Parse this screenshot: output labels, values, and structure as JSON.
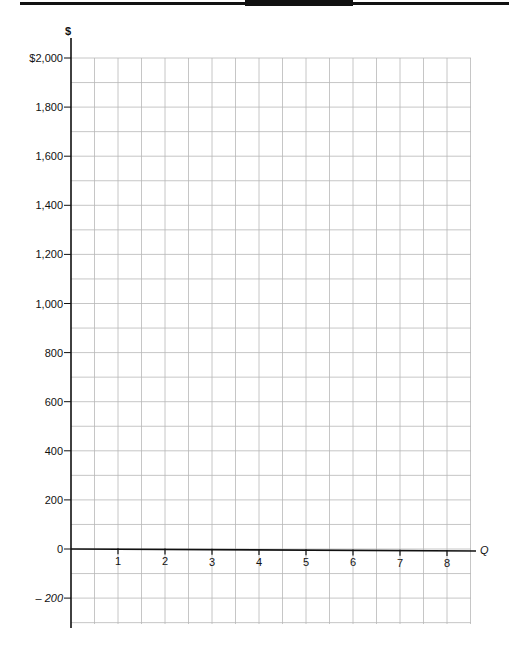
{
  "chart_data": {
    "type": "line",
    "title": "",
    "xlabel": "Q",
    "ylabel": "$",
    "x_ticks": [
      "1",
      "2",
      "3",
      "4",
      "5",
      "6",
      "7",
      "8"
    ],
    "y_ticks": [
      "$2,000",
      "1,800",
      "1,600",
      "1,400",
      "1,200",
      "1,000",
      "800",
      "600",
      "400",
      "200",
      "0",
      "– 200"
    ],
    "y_tick_values": [
      2000,
      1800,
      1600,
      1400,
      1200,
      1000,
      800,
      600,
      400,
      200,
      0,
      -200
    ],
    "xlim": [
      0,
      8.5
    ],
    "ylim": [
      -300,
      2000
    ],
    "grid": true,
    "grid_minor_x": 0.5,
    "grid_minor_y": 100,
    "series": [],
    "note": "Blank graph grid for plotting; no data series drawn"
  },
  "colors": {
    "axis": "#111111",
    "grid": "#b8b8b8",
    "text": "#111111"
  }
}
